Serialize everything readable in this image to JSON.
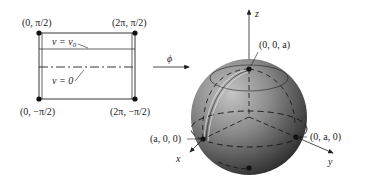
{
  "rectangle": {
    "corners": {
      "top_left": "(0, π/2)",
      "top_right": "(2π, π/2)",
      "bottom_left": "(0, −π/2)",
      "bottom_right": "(2π, −π/2)"
    },
    "line_labels": {
      "v_v0": "v = v",
      "v_v0_sub": "0",
      "v_zero": "v = 0"
    }
  },
  "mapping": {
    "arrow_label": "ϕ"
  },
  "sphere": {
    "axes": {
      "x": "x",
      "y": "y",
      "z": "z"
    },
    "points": {
      "north": "(0, 0, a)",
      "x_point": "(a, 0, 0)",
      "y_point": "(0, a, 0)"
    }
  },
  "colors": {
    "ink": "#222222",
    "sphere_light": "#b8b8b8",
    "sphere_dark": "#2e2e2e",
    "background": "#ffffff"
  }
}
